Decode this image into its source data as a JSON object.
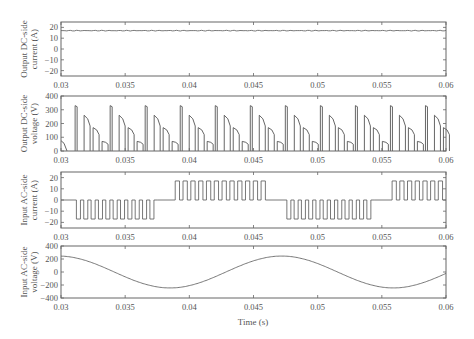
{
  "figure": {
    "xlabel": "Time (s)",
    "xticks": [
      "0.03",
      "0.035",
      "0.04",
      "0.045",
      "0.05",
      "0.055",
      "0.06"
    ],
    "line_color": "#555555",
    "axis_color": "#666666"
  },
  "chart_data": [
    {
      "type": "line",
      "title": "",
      "ylabel": [
        "Output DC-side",
        "current (A)"
      ],
      "xlabel": "",
      "xlim": [
        0.03,
        0.06
      ],
      "ylim": [
        -25,
        25
      ],
      "yticks": [
        20,
        10,
        0,
        -10,
        -20
      ],
      "ytick_labels": [
        "20",
        "10",
        "0",
        "−10",
        "−20"
      ],
      "grid": false,
      "series": [
        {
          "name": "Output DC-side current",
          "description": "nearly constant ~17 A with small ripple",
          "x": [
            0.03,
            0.045,
            0.06
          ],
          "y": [
            17,
            17,
            17
          ]
        }
      ]
    },
    {
      "type": "line",
      "title": "",
      "ylabel": [
        "Output DC-side",
        "voltage (V)"
      ],
      "xlabel": "",
      "xlim": [
        0.03,
        0.06
      ],
      "ylim": [
        0,
        400
      ],
      "yticks": [
        400,
        300,
        200,
        100,
        0
      ],
      "ytick_labels": [
        "400",
        "300",
        "200",
        "100",
        "0"
      ],
      "grid": false,
      "series": [
        {
          "name": "Output DC-side voltage",
          "description": "PWM pulse groups repeating every ~0.0027 s; each group has 4 pulses with descending peaks",
          "group_period_s": 0.00273,
          "first_group_start_s": 0.0311,
          "pulse_peaks_V": [
            330,
            260,
            170,
            70
          ],
          "pulse_offsets_s": [
            0,
            0.0007,
            0.0014,
            0.0021
          ],
          "initial_pulse": {
            "x": 0.03,
            "peak_V": 75
          }
        }
      ]
    },
    {
      "type": "line",
      "title": "",
      "ylabel": [
        "Input AC-side",
        "current (A)"
      ],
      "xlabel": "",
      "xlim": [
        0.03,
        0.06
      ],
      "ylim": [
        -25,
        25
      ],
      "yticks": [
        20,
        10,
        0,
        -10,
        -20
      ],
      "ytick_labels": [
        "20",
        "10",
        "0",
        "−10",
        "−20"
      ],
      "grid": false,
      "series": [
        {
          "name": "Input AC-side current",
          "description": "Square-wave PWM bursts of ±17 A alternating polarity each half-cycle, with zero gaps",
          "bursts": [
            {
              "start": 0.0312,
              "end": 0.0375,
              "level": -17,
              "pulses": 11
            },
            {
              "start": 0.0389,
              "end": 0.0462,
              "level": 17,
              "pulses": 12
            },
            {
              "start": 0.0476,
              "end": 0.0544,
              "level": -17,
              "pulses": 12
            },
            {
              "start": 0.0558,
              "end": 0.06,
              "level": 17,
              "pulses": 7
            }
          ]
        }
      ]
    },
    {
      "type": "line",
      "title": "",
      "ylabel": [
        "Input AC-side",
        "voltage (V)"
      ],
      "xlabel": "Time (s)",
      "xlim": [
        0.03,
        0.06
      ],
      "ylim": [
        -400,
        400
      ],
      "yticks": [
        400,
        200,
        0,
        -200,
        -400
      ],
      "ytick_labels": [
        "400",
        "200",
        "0",
        "−200",
        "−400"
      ],
      "grid": false,
      "series": [
        {
          "name": "Input AC-side voltage",
          "description": "Sinusoid, amplitude ~245 V, frequency ~58 Hz",
          "x": [
            0.03,
            0.0325,
            0.035,
            0.0385,
            0.041,
            0.0435,
            0.0472,
            0.05,
            0.0525,
            0.0555,
            0.058,
            0.06
          ],
          "y": [
            245,
            180,
            0,
            -245,
            -190,
            40,
            245,
            130,
            -60,
            -245,
            -150,
            40
          ]
        }
      ]
    }
  ]
}
